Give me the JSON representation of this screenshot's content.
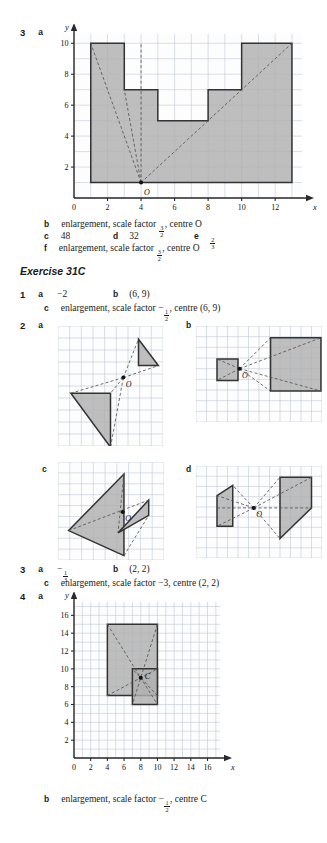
{
  "page": {
    "background": "#ffffff",
    "grid_color": "#b9c4d6",
    "shape_fill": "#b0b0b0",
    "shape_stroke": "#333333",
    "dash_color": "#555555",
    "axis_color": "#2a2a2a"
  },
  "q3_top": {
    "number": "3",
    "part_a": "a",
    "chart_data": {
      "type": "scatter",
      "title": "",
      "xlabel": "x",
      "ylabel": "y",
      "xlim": [
        0,
        13.6
      ],
      "ylim": [
        0,
        10.6
      ],
      "xticks": [
        0,
        2,
        4,
        6,
        8,
        10,
        12
      ],
      "yticks": [
        0,
        2,
        4,
        6,
        8,
        10
      ],
      "grid": true,
      "centre_label": "O",
      "centre_point": [
        4,
        1
      ],
      "shapes": [
        {
          "name": "battlement-outline",
          "points": [
            [
              1,
              1
            ],
            [
              1,
              10
            ],
            [
              3,
              10
            ],
            [
              3,
              7
            ],
            [
              5,
              7
            ],
            [
              5,
              5
            ],
            [
              8,
              5
            ],
            [
              8,
              7
            ],
            [
              10,
              7
            ],
            [
              10,
              10
            ],
            [
              13,
              10
            ],
            [
              13,
              1
            ]
          ]
        }
      ],
      "rays": [
        [
          [
            4,
            1
          ],
          [
            1,
            10
          ]
        ],
        [
          [
            4,
            1
          ],
          [
            3,
            7
          ]
        ],
        [
          [
            4,
            1
          ],
          [
            13,
            10
          ]
        ],
        [
          [
            4,
            1
          ],
          [
            4,
            10
          ]
        ]
      ]
    },
    "answers": [
      {
        "label": "b",
        "text_pre": "enlargement, scale factor ",
        "frac_num": "3",
        "frac_den": "2",
        "text_post": ", centre O"
      },
      {
        "label": "c",
        "text": "48"
      },
      {
        "label": "d",
        "text": "32"
      },
      {
        "label": "e",
        "frac_num": "2",
        "frac_den": "3"
      },
      {
        "label": "f",
        "text_pre": "enlargement, scale factor ",
        "frac_num": "3",
        "frac_den": "2",
        "text_post": ", centre O"
      }
    ]
  },
  "exercise": {
    "heading": "Exercise 31C"
  },
  "q1": {
    "number": "1",
    "a_label": "a",
    "a_value": "−2",
    "b_label": "b",
    "b_value": "(6, 9)",
    "c_label": "c",
    "c_pre": "enlargement, scale factor −",
    "c_frac_num": "1",
    "c_frac_den": "2",
    "c_post": ", centre (6, 9)"
  },
  "q2": {
    "number": "2",
    "panels": [
      {
        "label": "a",
        "centre_label": "O",
        "centre": [
          5.6,
          4.3
        ],
        "cols": 9,
        "rows": 10,
        "shapes": [
          {
            "name": "small-triangle",
            "points": [
              [
                6.9,
                1.1
              ],
              [
                8.6,
                3.3
              ],
              [
                6.9,
                3.3
              ]
            ]
          },
          {
            "name": "large-triangle",
            "points": [
              [
                1.1,
                5.6
              ],
              [
                4.5,
                5.6
              ],
              [
                4.5,
                10.1
              ]
            ]
          }
        ],
        "rays": [
          [
            [
              5.6,
              4.3
            ],
            [
              6.9,
              1.1
            ]
          ],
          [
            [
              5.6,
              4.3
            ],
            [
              8.6,
              3.3
            ]
          ],
          [
            [
              5.6,
              4.3
            ],
            [
              1.1,
              5.6
            ]
          ],
          [
            [
              5.6,
              4.3
            ],
            [
              4.5,
              10.1
            ]
          ],
          [
            [
              5.6,
              4.3
            ],
            [
              4.5,
              5.6
            ]
          ]
        ]
      },
      {
        "label": "b",
        "centre_label": "O",
        "centre": [
          4.15,
          4.0
        ],
        "cols": 12,
        "rows": 9,
        "shapes": [
          {
            "name": "small-square",
            "points": [
              [
                2.0,
                3.1
              ],
              [
                4.0,
                3.1
              ],
              [
                4.0,
                5.1
              ],
              [
                2.0,
                5.1
              ]
            ]
          },
          {
            "name": "large-square",
            "points": [
              [
                7.1,
                1.1
              ],
              [
                11.9,
                1.1
              ],
              [
                11.9,
                6.1
              ],
              [
                7.1,
                6.1
              ]
            ]
          }
        ],
        "rays": [
          [
            [
              4.15,
              4.0
            ],
            [
              7.1,
              1.1
            ]
          ],
          [
            [
              4.15,
              4.0
            ],
            [
              11.9,
              1.1
            ]
          ],
          [
            [
              4.15,
              4.0
            ],
            [
              7.1,
              6.1
            ]
          ],
          [
            [
              4.15,
              4.0
            ],
            [
              11.9,
              6.1
            ]
          ],
          [
            [
              4.15,
              4.0
            ],
            [
              2.0,
              3.1
            ]
          ],
          [
            [
              4.15,
              4.0
            ],
            [
              2.0,
              5.1
            ]
          ]
        ]
      },
      {
        "label": "c",
        "centre_label": "O",
        "centre": [
          5.5,
          4.6
        ],
        "cols": 9,
        "rows": 9,
        "shapes": [
          {
            "name": "large-triangle",
            "points": [
              [
                0.9,
                6.3
              ],
              [
                5.6,
                1.1
              ],
              [
                5.6,
                8.6
              ]
            ]
          },
          {
            "name": "small-triangle",
            "points": [
              [
                7.7,
                3.5
              ],
              [
                5.1,
                6.5
              ],
              [
                7.7,
                4.9
              ]
            ]
          }
        ],
        "rays": [
          [
            [
              0.9,
              6.3
            ],
            [
              7.7,
              3.5
            ]
          ],
          [
            [
              5.6,
              1.1
            ],
            [
              5.1,
              6.5
            ]
          ],
          [
            [
              5.6,
              8.6
            ],
            [
              7.7,
              4.9
            ]
          ]
        ]
      },
      {
        "label": "d",
        "centre_label": "O",
        "centre": [
          5.5,
          4.1
        ],
        "cols": 12,
        "rows": 9,
        "shapes": [
          {
            "name": "small-trapezium",
            "points": [
              [
                2.0,
                2.9
              ],
              [
                3.5,
                1.9
              ],
              [
                3.5,
                5.9
              ],
              [
                2.0,
                5.9
              ]
            ]
          },
          {
            "name": "large-trapezium",
            "points": [
              [
                8.0,
                1.1
              ],
              [
                11.0,
                1.1
              ],
              [
                11.0,
                4.1
              ],
              [
                8.0,
                7.1
              ]
            ]
          }
        ],
        "rays": [
          [
            [
              2.0,
              4.1
            ],
            [
              11.0,
              4.1
            ]
          ],
          [
            [
              5.5,
              4.1
            ],
            [
              8.0,
              1.1
            ]
          ],
          [
            [
              5.5,
              4.1
            ],
            [
              11.0,
              1.1
            ]
          ],
          [
            [
              5.5,
              4.1
            ],
            [
              8.0,
              7.1
            ]
          ],
          [
            [
              5.5,
              4.1
            ],
            [
              2.0,
              2.9
            ]
          ],
          [
            [
              5.5,
              4.1
            ],
            [
              2.0,
              5.9
            ]
          ],
          [
            [
              5.5,
              4.1
            ],
            [
              3.5,
              1.9
            ]
          ]
        ]
      }
    ]
  },
  "q3_bottom": {
    "number": "3",
    "a_label": "a",
    "a_frac_sign": "−",
    "a_frac_num": "1",
    "a_frac_den": "3",
    "b_label": "b",
    "b_value": "(2, 2)",
    "c_label": "c",
    "c_value": "enlargement, scale factor −3, centre (2, 2)"
  },
  "q4": {
    "number": "4",
    "a_label": "a",
    "chart_data": {
      "type": "scatter",
      "title": "",
      "xlabel": "x",
      "ylabel": "y",
      "xlim": [
        0,
        17.5
      ],
      "ylim": [
        0,
        17.5
      ],
      "xticks": [
        0,
        2,
        4,
        6,
        8,
        10,
        12,
        14,
        16
      ],
      "yticks": [
        0,
        2,
        4,
        6,
        8,
        10,
        12,
        14,
        16
      ],
      "grid": true,
      "centre_label": "C",
      "centre_point": [
        8,
        9
      ],
      "shapes": [
        {
          "name": "large-rectangle",
          "points": [
            [
              4,
              7
            ],
            [
              10,
              7
            ],
            [
              10,
              15
            ],
            [
              4,
              15
            ]
          ]
        },
        {
          "name": "small-rectangle",
          "points": [
            [
              7,
              6
            ],
            [
              10,
              6
            ],
            [
              10,
              10
            ],
            [
              7,
              10
            ]
          ]
        }
      ],
      "rays": [
        [
          [
            4,
            15
          ],
          [
            10,
            6
          ]
        ],
        [
          [
            10,
            15
          ],
          [
            7,
            6
          ]
        ],
        [
          [
            4,
            7
          ],
          [
            10,
            10
          ]
        ],
        [
          [
            10,
            7
          ],
          [
            7,
            10
          ]
        ]
      ]
    },
    "b_label": "b",
    "b_pre": "enlargement, scale factor −",
    "b_frac_num": "1",
    "b_frac_den": "2",
    "b_post": ", centre C"
  }
}
